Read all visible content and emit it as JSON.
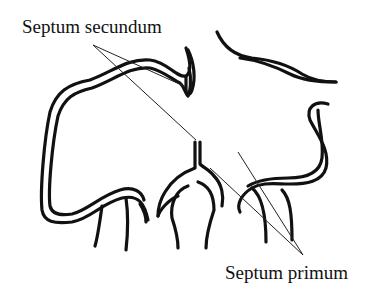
{
  "figure": {
    "type": "anatomical line drawing",
    "labels": [
      {
        "id": "septum-secundum",
        "text": "Septum secundum"
      },
      {
        "id": "septum-primum",
        "text": "Septum primum"
      }
    ]
  },
  "colors": {
    "ink": "#111111",
    "background": "#ffffff"
  }
}
